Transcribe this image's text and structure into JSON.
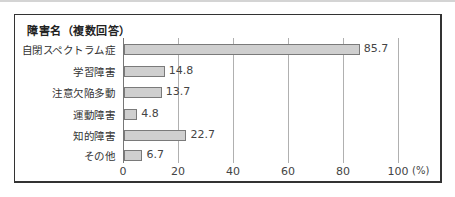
{
  "chart_data": {
    "type": "bar",
    "orientation": "horizontal",
    "title": "障害名（複数回答）",
    "categories": [
      "自閉スペクトラム症",
      "学習障害",
      "注意欠陥多動",
      "運動障害",
      "知的障害",
      "その他"
    ],
    "values": [
      85.7,
      14.8,
      13.7,
      4.8,
      22.7,
      6.7
    ],
    "value_labels": [
      "85.7",
      "14.8",
      "13.7",
      "4.8",
      "22.7",
      "6.7"
    ],
    "xlabel": "",
    "ylabel": "",
    "x_unit": "(%)",
    "xlim": [
      0,
      100
    ],
    "xticks": [
      "0",
      "20",
      "40",
      "60",
      "80",
      "100"
    ],
    "grid": true,
    "legend": null,
    "bar_color": "#cfcfcf"
  }
}
